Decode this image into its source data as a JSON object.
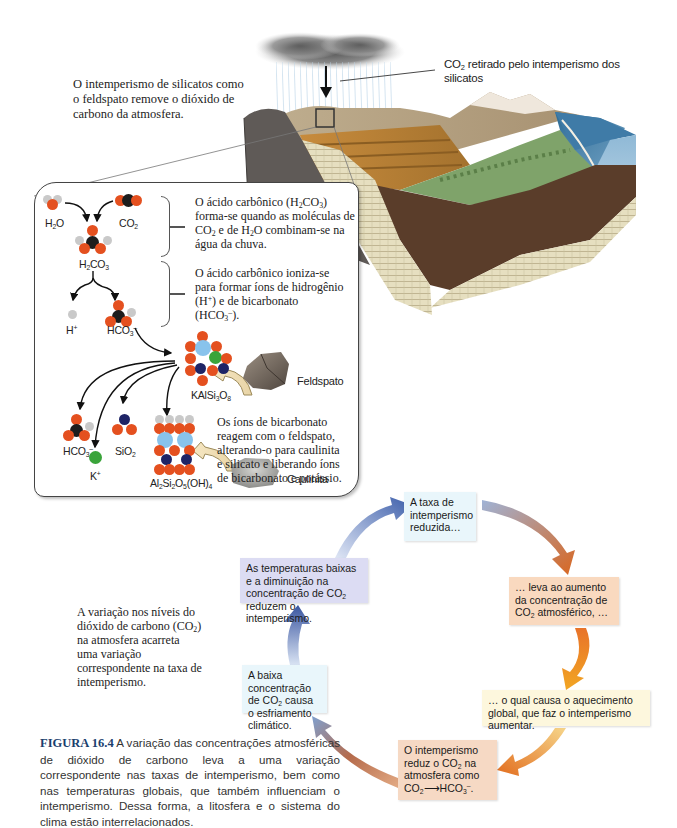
{
  "intro_text": "O intemperismo de silicatos como o feldspato remove o dióxido de carbono da atmosfera.",
  "landscape": {
    "callout": {
      "prefix": "CO",
      "sub": "2",
      "suffix": " retirado pelo intemperismo dos silicatos"
    }
  },
  "inset": {
    "molecules": {
      "h2o": {
        "base": "H",
        "sub": "2",
        "rest": "O"
      },
      "co2": {
        "base": "CO",
        "sub": "2"
      },
      "h2co3": {
        "a": "H",
        "sub1": "2",
        "b": "CO",
        "sub2": "3"
      },
      "h_ion": {
        "base": "H",
        "sup": "+"
      },
      "hco3_ion": {
        "base": "HCO",
        "sub": "3",
        "sup": "–"
      },
      "kalsi3o8": {
        "a": "KAlSi",
        "sub1": "3",
        "b": "O",
        "sub2": "8"
      },
      "hco3_out": {
        "base": "HCO",
        "sub": "3",
        "sup": "–"
      },
      "sio2": {
        "base": "SiO",
        "sub": "2"
      },
      "k_ion": {
        "base": "K",
        "sup": "+"
      },
      "kaolinite_formula": {
        "a": "Al",
        "s1": "2",
        "b": "Si",
        "s2": "2",
        "c": "O",
        "s3": "5",
        "d": "(OH)",
        "s4": "4"
      }
    },
    "minerals": {
      "feldspar": "Feldspato",
      "kaolinite": "Caulinita"
    },
    "notes": {
      "carbonic_acid_form": {
        "p1": "O ácido carbônico (H",
        "s1": "2",
        "p2": "CO",
        "s2": "3",
        "p3": ") forma-se quando as moléculas de CO",
        "s3": "2",
        "p4": " e de H",
        "s4": "2",
        "p5": "O combinam-se na água da chuva."
      },
      "carbonic_acid_ionize": {
        "p1": "O ácido carbônico ioniza-se para formar íons de hidrogênio (H",
        "sup1": "+",
        "p2": ") e de bicarbonato (HCO",
        "s1": "3",
        "sup2": "–",
        "p3": ")."
      },
      "bicarbonate_reaction": "Os íons de bicarbonato reagem com o feldspato, alterando-o para caulinita e silicato e liberando íons de bicarbonato e potássio."
    }
  },
  "cycle": {
    "steps": [
      {
        "id": "reduced-weathering",
        "text": "A taxa de intemperismo reduzida…",
        "color": "#e9f6fb"
      },
      {
        "id": "co2-increase",
        "p1": "… leva ao aumento da concentração de CO",
        "sub": "2",
        "p2": " atmosférico, …",
        "color": "#f9d9bf"
      },
      {
        "id": "global-warming",
        "text": "… o qual causa o aquecimento global, que faz o intemperismo aumentar.",
        "color": "#fdf7dd"
      },
      {
        "id": "weathering-reduces-co2",
        "p1": "O intemperismo reduz o CO",
        "sub": "2",
        "p2": " na atmosfera como",
        "eq_a": "CO",
        "eq_sub_a": "2",
        "eq_b": "HCO",
        "eq_sub_b": "3",
        "eq_sup_b": "–",
        "eq_end": ".",
        "color": "#f6d9c4"
      },
      {
        "id": "low-co2-cooling",
        "p1": "A baixa concentração de CO",
        "sub": "2",
        "p2": " causa o esfriamento climático.",
        "color": "#e9f6fb"
      },
      {
        "id": "low-temps",
        "p1": "As temperaturas baixas e a diminuição na concentração de CO",
        "sub": "2",
        "p2": " reduzem o intemperismo.",
        "color": "#dcdcf3"
      }
    ],
    "side_note": {
      "p1": "A variação nos níveis do dióxido de carbono (CO",
      "sub": "2",
      "p2": ") na atmosfera acarreta uma variação correspondente na taxa de intemperismo."
    }
  },
  "caption": {
    "figure_label": "FIGURA 16.4",
    "text": " A variação das concentrações atmosféricas de dióxido de carbono leva a uma variação correspondente nas taxas de intemperismo, bem como nas temperaturas globais, que também influenciam o intemperismo. Dessa forma, a litosfera e o sistema do clima estão interrelacionados."
  },
  "colors": {
    "oxygen": "#e4501f",
    "carbon": "#1d1d1d",
    "hydrogen": "#c9c9c9",
    "silicon": "#1e2466",
    "aluminum": "#88c3ec",
    "potassium": "#3aa43a",
    "figure_label": "#1b3f6e"
  }
}
